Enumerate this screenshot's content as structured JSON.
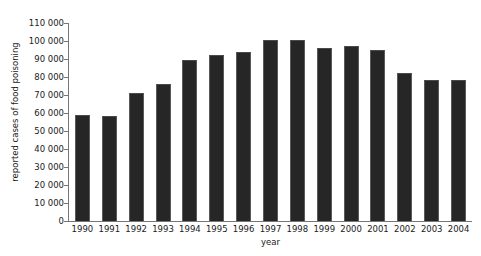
{
  "chart_data": {
    "type": "bar",
    "title": "",
    "xlabel": "year",
    "ylabel": "reported cases of food poisoning",
    "categories": [
      "1990",
      "1991",
      "1992",
      "1993",
      "1994",
      "1995",
      "1996",
      "1997",
      "1998",
      "1999",
      "2000",
      "2001",
      "2002",
      "2003",
      "2004"
    ],
    "values": [
      59000,
      58500,
      71000,
      76000,
      89500,
      92000,
      94000,
      100500,
      100500,
      96000,
      97500,
      95000,
      82000,
      78500,
      78500
    ],
    "ylim": [
      0,
      110000
    ],
    "ytick_values": [
      0,
      10000,
      20000,
      30000,
      40000,
      50000,
      60000,
      70000,
      80000,
      90000,
      100000,
      110000
    ],
    "ytick_labels": [
      "0",
      "10 000",
      "20 000",
      "30 000",
      "40 000",
      "50 000",
      "60 000",
      "70 000",
      "80 000",
      "90 000",
      "100 000",
      "110 000"
    ],
    "grid": false,
    "legend": false,
    "legend_position": "none",
    "bar_color": "#262626",
    "axis_color": "#767676",
    "background_color": "#ffffff"
  }
}
